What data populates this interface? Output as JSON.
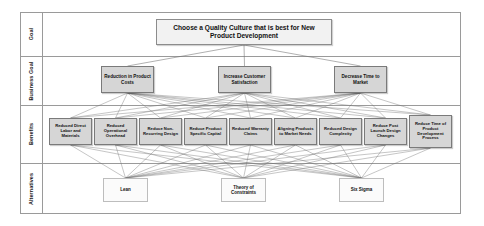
{
  "diagram": {
    "title_text": "Choose a Quality Culture that is best for New Product Development",
    "rows": [
      {
        "id": "goal",
        "label": "Goal"
      },
      {
        "id": "business_goal",
        "label": "Business Goal"
      },
      {
        "id": "benefits",
        "label": "Benefits"
      },
      {
        "id": "alternatives",
        "label": "Alternatives"
      }
    ],
    "goal": {
      "label": "Choose a Quality Culture that is best for New Product Development"
    },
    "business_goals": [
      {
        "id": "bg1",
        "label": "Reduction in Product Costs"
      },
      {
        "id": "bg2",
        "label": "Increase Customer Satisfaction"
      },
      {
        "id": "bg3",
        "label": "Decrease Time to Market"
      }
    ],
    "benefits": [
      {
        "id": "b1",
        "label": "Reduced Direct Labor and Materials"
      },
      {
        "id": "b2",
        "label": "Reduced Operational Overhead"
      },
      {
        "id": "b3",
        "label": "Reduce Non-Recurring Design"
      },
      {
        "id": "b4",
        "label": "Reduce Product Specific Capital"
      },
      {
        "id": "b5",
        "label": "Reduced Warranty Claims"
      },
      {
        "id": "b6",
        "label": "Aligning Products to Market Needs"
      },
      {
        "id": "b7",
        "label": "Reduced Design Complexity"
      },
      {
        "id": "b8",
        "label": "Reduce Post Launch Design Changes"
      },
      {
        "id": "b9",
        "label": "Reduce Time of Product Development Process"
      }
    ],
    "alternatives": [
      {
        "id": "a1",
        "label": "Lean"
      },
      {
        "id": "a2",
        "label": "Theory of Constraints"
      },
      {
        "id": "a3",
        "label": "Six Sigma"
      }
    ],
    "colors": {
      "frame_border": "#9a9a9a",
      "goal_fill": "#f2f2f2",
      "business_goal_fill": "#d6d6d6",
      "benefit_fill": "#d6d6d6",
      "alternative_fill": "#fbfbfb",
      "link_stroke": "#6e6e6e",
      "text": "#111111"
    }
  }
}
